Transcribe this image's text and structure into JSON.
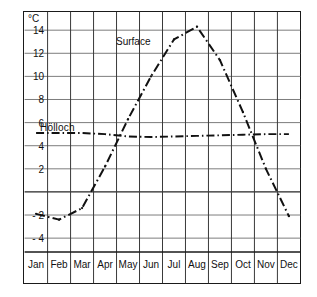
{
  "chart_data": {
    "type": "line",
    "title": "",
    "subtitle": "",
    "xlabel": "",
    "ylabel": "",
    "yunit": "°C",
    "grid": true,
    "legend_position": "inline-annotation",
    "categories": [
      "Jan",
      "Feb",
      "Mar",
      "Apr",
      "May",
      "Jun",
      "Jul",
      "Aug",
      "Sep",
      "Oct",
      "Nov",
      "Dec"
    ],
    "y_ticks": [
      14,
      12,
      10,
      8,
      6,
      4,
      2,
      -2,
      -4
    ],
    "y_tick_labels": [
      "14",
      "12",
      "10",
      "8",
      "6",
      "4",
      "2",
      "- 2",
      "- 4"
    ],
    "ylim": [
      -5.2,
      15.4
    ],
    "zero_line": 0,
    "series": [
      {
        "name": "Surface",
        "line_style": "dash-dot",
        "color": "#111111",
        "values": [
          -1.9,
          -2.4,
          -1.4,
          2.2,
          6.3,
          10.0,
          13.2,
          14.3,
          11.4,
          6.9,
          2.0,
          -2.1
        ]
      },
      {
        "name": "Hölloch",
        "line_style": "dash-dot",
        "color": "#111111",
        "values": [
          5.1,
          5.1,
          5.1,
          5.0,
          4.8,
          4.75,
          4.8,
          4.85,
          4.9,
          4.95,
          5.0,
          5.0
        ]
      }
    ],
    "annotations": [
      {
        "text": "Surface",
        "series": "Surface"
      },
      {
        "text": "Hölloch",
        "series": "Hölloch"
      }
    ]
  },
  "axis": {
    "unit_label": "°C"
  }
}
